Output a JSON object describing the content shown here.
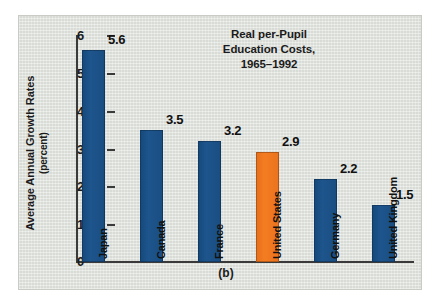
{
  "figure": {
    "caption": "(b)",
    "panel_color": "#dfe2dc",
    "bar_color": "#1a4e83",
    "highlight_color": "#ee7723"
  },
  "chart_data": {
    "type": "bar",
    "title": "Real per-Pupil Education Costs, 1965–1992",
    "title_lines": [
      "Real per-Pupil",
      "Education Costs,",
      "1965–1992"
    ],
    "xlabel": "",
    "ylabel": "Average Annual Growth Rates (percent)",
    "ylabel_lines": [
      "Average Annual Growth Rates",
      "(percent)"
    ],
    "categories": [
      "Japan",
      "Canada",
      "France",
      "United States",
      "Germany",
      "United Kingdom"
    ],
    "values": [
      5.6,
      3.5,
      3.2,
      2.9,
      2.2,
      1.5
    ],
    "value_labels": [
      "5.6",
      "3.5",
      "3.2",
      "2.9",
      "2.2",
      "1.5"
    ],
    "highlight_index": 3,
    "ylim": [
      0,
      6
    ],
    "yticks": [
      0,
      1,
      2,
      3,
      4,
      5,
      6
    ],
    "ytick_labels": [
      "0",
      "1",
      "2",
      "3",
      "4",
      "5",
      "6"
    ],
    "grid": false,
    "legend": false
  }
}
